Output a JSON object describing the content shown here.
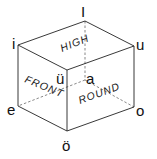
{
  "diagram": {
    "vertices": {
      "top_left": "i",
      "top_back": "I",
      "top_right": "u",
      "front_top": "ü",
      "back_center": "a",
      "bottom_left": "e",
      "bottom_front": "ö",
      "bottom_right": "o"
    },
    "faces": {
      "top": "HIGH",
      "left": "FRONT",
      "right": "ROUND"
    },
    "colors": {
      "line": "#222222",
      "text": "#111111",
      "background": "#ffffff"
    }
  }
}
